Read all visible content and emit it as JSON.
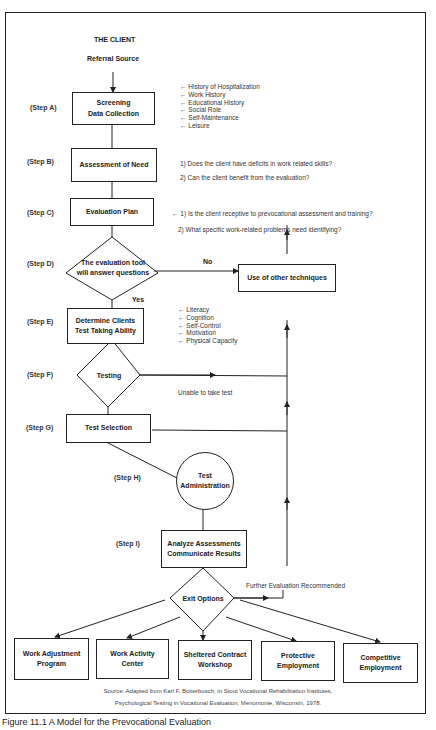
{
  "header": {
    "title": "THE CLIENT",
    "subtitle": "Referral Source"
  },
  "steps": {
    "a": {
      "label": "(Step A)",
      "box": [
        "Screening",
        "Data Collection"
      ],
      "notes": [
        "History of Hospitalization",
        "Work History",
        "Educational History",
        "Social Role",
        "Self-Maintenance",
        "Leisure"
      ]
    },
    "b": {
      "label": "(Step B)",
      "box": "Assessment of Need",
      "questions": [
        "1) Does the client have deficits in work related skills?",
        "2) Can the client benefit from the evaluation?"
      ]
    },
    "c": {
      "label": "(Step C)",
      "box": "Evaluation Plan",
      "questions": [
        "1) Is the client receptive to prevocational assessment and training?",
        "2) What specific work-related problems need identifying?"
      ]
    },
    "d": {
      "label": "(Step D)",
      "diamond": [
        "The evaluation tool",
        "will answer questions"
      ],
      "no_label": "No",
      "yes_label": "Yes",
      "alt_box": "Use of other techniques"
    },
    "e": {
      "label": "(Step E)",
      "box": [
        "Determine Clients",
        "Test Taking Ability"
      ],
      "notes": [
        "Literacy",
        "Cognition",
        "Self-Control",
        "Motivation",
        "Physical Capacity"
      ]
    },
    "f": {
      "label": "(Step F)",
      "diamond": "Testing",
      "branch_label": "Unable to take test"
    },
    "g": {
      "label": "(Step G)",
      "box": "Test Selection"
    },
    "h": {
      "label": "(Step H)",
      "circle": [
        "Test",
        "Administration"
      ]
    },
    "i": {
      "label": "(Step I)",
      "box": [
        "Analyze Assessments",
        "Communicate Results"
      ]
    }
  },
  "exit": {
    "diamond": "Exit Options",
    "further_label": "Further Evaluation Recommended",
    "options": [
      [
        "Work Adjustment",
        "Program"
      ],
      [
        "Work Activity",
        "Center"
      ],
      [
        "Sheltered Contract",
        "Workshop"
      ],
      [
        "Protective",
        "Employment"
      ],
      [
        "Competitive",
        "Employment"
      ]
    ]
  },
  "source": {
    "line1": "Source: Adapted from Karl F. Botterbusch, in Stout Vocational Rehabilitation Institutes,",
    "line2": "Psychological Testing in Vocational Evaluation, Menomonie, Wisconsin, 1978."
  },
  "caption": "Figure 11.1 A Model for the Prevocational Evaluation"
}
